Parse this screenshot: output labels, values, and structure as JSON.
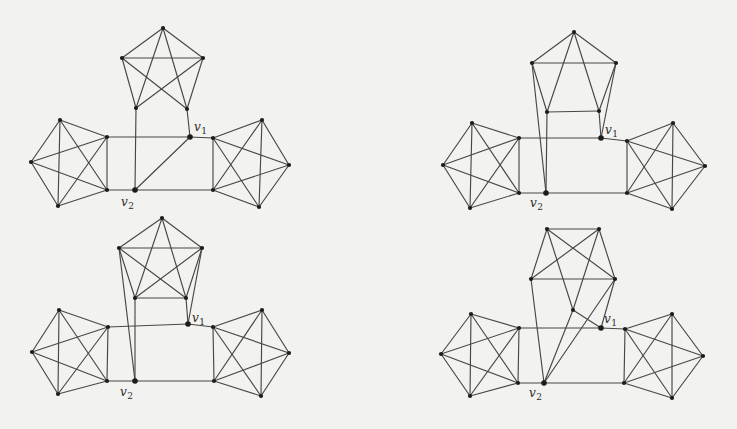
{
  "canvas": {
    "width": 737,
    "height": 429,
    "background": "#f2f2f0"
  },
  "ink": {
    "edge_color": "#474747",
    "node_color": "#1c1c1c",
    "label_color": "#2b2b2b"
  },
  "figures": [
    {
      "name": "graph-figure-1",
      "description": "three K5 cliques joined at v1 and v2; top clique open at bottom, v1-v2 edge present",
      "nodes": {
        "top_a": [
          163,
          28
        ],
        "top_ul": [
          122,
          58
        ],
        "top_ur": [
          203,
          58
        ],
        "top_ll": [
          136,
          108
        ],
        "top_lr": [
          187,
          109
        ],
        "v1": [
          190,
          137
        ],
        "v2": [
          135,
          190
        ],
        "lft_t": [
          60,
          120
        ],
        "lft_l": [
          31,
          162
        ],
        "lft_b": [
          58,
          206
        ],
        "lft_rt": [
          107,
          137
        ],
        "lft_rb": [
          107,
          190
        ],
        "rgt_lt": [
          213,
          138
        ],
        "rgt_t": [
          262,
          120
        ],
        "rgt_r": [
          289,
          165
        ],
        "rgt_b": [
          259,
          207
        ],
        "rgt_lb": [
          213,
          190
        ]
      },
      "cliques": [
        [
          "lft_t",
          "lft_l",
          "lft_b",
          "lft_rt",
          "lft_rb"
        ],
        [
          "rgt_lt",
          "rgt_t",
          "rgt_r",
          "rgt_b",
          "rgt_lb"
        ]
      ],
      "edges": [
        [
          "top_a",
          "top_ul"
        ],
        [
          "top_a",
          "top_ur"
        ],
        [
          "top_a",
          "top_ll"
        ],
        [
          "top_a",
          "top_lr"
        ],
        [
          "top_ul",
          "top_ur"
        ],
        [
          "top_ul",
          "top_ll"
        ],
        [
          "top_ur",
          "top_lr"
        ],
        [
          "top_ul",
          "top_lr"
        ],
        [
          "top_ur",
          "top_ll"
        ],
        [
          "top_ll",
          "v2"
        ],
        [
          "top_lr",
          "v1"
        ],
        [
          "v1",
          "v2"
        ],
        [
          "lft_rt",
          "v1"
        ],
        [
          "v1",
          "rgt_lt"
        ],
        [
          "lft_rb",
          "v2"
        ],
        [
          "v2",
          "rgt_lb"
        ]
      ],
      "labels": [
        {
          "base": "v",
          "sub": "1",
          "x": 194,
          "y": 121
        },
        {
          "base": "v",
          "sub": "2",
          "x": 121,
          "y": 196
        }
      ]
    },
    {
      "name": "graph-figure-2",
      "description": "top clique drawn as trapezoid without cross diagonals; UL,LL drop to v2 and UR,LR drop to v1",
      "nodes": {
        "top_a": [
          574,
          32
        ],
        "top_ul": [
          532,
          63
        ],
        "top_ur": [
          616,
          63
        ],
        "top_ll": [
          547,
          112
        ],
        "top_lr": [
          599,
          111
        ],
        "v1": [
          601,
          138
        ],
        "v2": [
          546,
          193
        ],
        "lft_t": [
          472,
          123
        ],
        "lft_l": [
          443,
          165
        ],
        "lft_b": [
          470,
          208
        ],
        "lft_rt": [
          519,
          138
        ],
        "lft_rb": [
          519,
          193
        ],
        "rgt_lt": [
          627,
          141
        ],
        "rgt_t": [
          673,
          123
        ],
        "rgt_r": [
          705,
          166
        ],
        "rgt_b": [
          672,
          209
        ],
        "rgt_lb": [
          627,
          193
        ]
      },
      "cliques": [
        [
          "lft_t",
          "lft_l",
          "lft_b",
          "lft_rt",
          "lft_rb"
        ],
        [
          "rgt_lt",
          "rgt_t",
          "rgt_r",
          "rgt_b",
          "rgt_lb"
        ]
      ],
      "edges": [
        [
          "top_a",
          "top_ul"
        ],
        [
          "top_a",
          "top_ur"
        ],
        [
          "top_a",
          "top_ll"
        ],
        [
          "top_a",
          "top_lr"
        ],
        [
          "top_ul",
          "top_ur"
        ],
        [
          "top_ll",
          "top_lr"
        ],
        [
          "top_ul",
          "top_ll"
        ],
        [
          "top_ur",
          "top_lr"
        ],
        [
          "top_ul",
          "v2"
        ],
        [
          "top_ll",
          "v2"
        ],
        [
          "top_ur",
          "v1"
        ],
        [
          "top_lr",
          "v1"
        ],
        [
          "lft_rt",
          "v1"
        ],
        [
          "v1",
          "rgt_lt"
        ],
        [
          "lft_rb",
          "v2"
        ],
        [
          "v2",
          "rgt_lb"
        ]
      ],
      "labels": [
        {
          "base": "v",
          "sub": "1",
          "x": 605,
          "y": 124
        },
        {
          "base": "v",
          "sub": "2",
          "x": 530,
          "y": 197
        }
      ]
    },
    {
      "name": "graph-figure-3",
      "description": "like figure 2 but top clique includes both cross diagonals (pentagram pattern)",
      "nodes": {
        "top_a": [
          162,
          218
        ],
        "top_ul": [
          119,
          248
        ],
        "top_ur": [
          202,
          248
        ],
        "top_ll": [
          135,
          298
        ],
        "top_lr": [
          186,
          298
        ],
        "v1": [
          188,
          324
        ],
        "v2": [
          135,
          381
        ],
        "lft_t": [
          59,
          310
        ],
        "lft_l": [
          32,
          352
        ],
        "lft_b": [
          58,
          394
        ],
        "lft_rt": [
          108,
          327
        ],
        "lft_rb": [
          107,
          381
        ],
        "rgt_lt": [
          213,
          327
        ],
        "rgt_t": [
          262,
          310
        ],
        "rgt_r": [
          289,
          353
        ],
        "rgt_b": [
          261,
          396
        ],
        "rgt_lb": [
          214,
          381
        ]
      },
      "cliques": [
        [
          "lft_t",
          "lft_l",
          "lft_b",
          "lft_rt",
          "lft_rb"
        ],
        [
          "rgt_lt",
          "rgt_t",
          "rgt_r",
          "rgt_b",
          "rgt_lb"
        ]
      ],
      "edges": [
        [
          "top_a",
          "top_ul"
        ],
        [
          "top_a",
          "top_ur"
        ],
        [
          "top_a",
          "top_ll"
        ],
        [
          "top_a",
          "top_lr"
        ],
        [
          "top_ul",
          "top_ur"
        ],
        [
          "top_ll",
          "top_lr"
        ],
        [
          "top_ul",
          "top_ll"
        ],
        [
          "top_ur",
          "top_lr"
        ],
        [
          "top_ul",
          "top_lr"
        ],
        [
          "top_ur",
          "top_ll"
        ],
        [
          "top_ul",
          "v2"
        ],
        [
          "top_ll",
          "v2"
        ],
        [
          "top_ur",
          "v1"
        ],
        [
          "top_lr",
          "v1"
        ],
        [
          "lft_rt",
          "v1"
        ],
        [
          "v1",
          "rgt_lt"
        ],
        [
          "lft_rb",
          "v2"
        ],
        [
          "v2",
          "rgt_lb"
        ]
      ],
      "labels": [
        {
          "base": "v",
          "sub": "1",
          "x": 192,
          "y": 312
        },
        {
          "base": "v",
          "sub": "2",
          "x": 120,
          "y": 386
        }
      ]
    },
    {
      "name": "graph-figure-4",
      "description": "top clique drawn as crossed square with low centre vertex; BL,C,BR drop to v2 and C,BR drop to v1",
      "nodes": {
        "top_tl": [
          547,
          229
        ],
        "top_tr": [
          599,
          229
        ],
        "top_bl": [
          531,
          279
        ],
        "top_br": [
          615,
          279
        ],
        "c": [
          573,
          310
        ],
        "v1": [
          601,
          328
        ],
        "v2": [
          544,
          383
        ],
        "lft_t": [
          471,
          314
        ],
        "lft_l": [
          441,
          354
        ],
        "lft_b": [
          470,
          396
        ],
        "lft_rt": [
          519,
          328
        ],
        "lft_rb": [
          518,
          383
        ],
        "rgt_lt": [
          625,
          329
        ],
        "rgt_t": [
          672,
          314
        ],
        "rgt_r": [
          703,
          356
        ],
        "rgt_b": [
          672,
          398
        ],
        "rgt_lb": [
          624,
          383
        ]
      },
      "cliques": [
        [
          "lft_t",
          "lft_l",
          "lft_b",
          "lft_rt",
          "lft_rb"
        ],
        [
          "rgt_lt",
          "rgt_t",
          "rgt_r",
          "rgt_b",
          "rgt_lb"
        ]
      ],
      "edges": [
        [
          "top_tl",
          "top_tr"
        ],
        [
          "top_bl",
          "top_br"
        ],
        [
          "top_tl",
          "top_bl"
        ],
        [
          "top_tr",
          "top_br"
        ],
        [
          "top_tl",
          "top_br"
        ],
        [
          "top_tr",
          "top_bl"
        ],
        [
          "top_tl",
          "c"
        ],
        [
          "top_tr",
          "c"
        ],
        [
          "c",
          "v1"
        ],
        [
          "top_br",
          "v1"
        ],
        [
          "top_bl",
          "v2"
        ],
        [
          "c",
          "v2"
        ],
        [
          "top_br",
          "v2"
        ],
        [
          "lft_rt",
          "v1"
        ],
        [
          "v1",
          "rgt_lt"
        ],
        [
          "lft_rb",
          "v2"
        ],
        [
          "v2",
          "rgt_lb"
        ]
      ],
      "labels": [
        {
          "base": "v",
          "sub": "1",
          "x": 604,
          "y": 313
        },
        {
          "base": "v",
          "sub": "2",
          "x": 529,
          "y": 387
        }
      ]
    }
  ]
}
